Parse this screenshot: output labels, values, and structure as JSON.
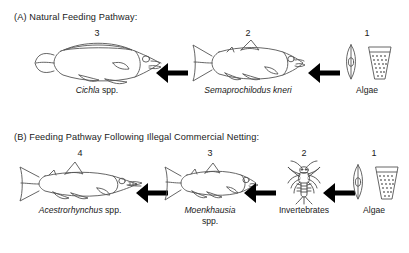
{
  "figure": {
    "panels": [
      {
        "id": "A",
        "title": "(A) Natural Feeding Pathway:",
        "nodes": [
          {
            "number": "3",
            "name_italic": "Cichla",
            "name_roman": " spp.",
            "icon": "cichlid-fish-icon"
          },
          {
            "number": "2",
            "name_italic": "Semaprochilodus kneri",
            "name_roman": "",
            "icon": "semaprochilodus-fish-icon"
          },
          {
            "number": "1",
            "name_italic": "",
            "name_roman": "Algae",
            "icon": "algae-diatom-icon"
          }
        ],
        "arrows": [
          {
            "icon": "left-arrow-icon"
          },
          {
            "icon": "left-arrow-icon"
          }
        ]
      },
      {
        "id": "B",
        "title": "(B) Feeding Pathway Following Illegal Commercial Netting:",
        "nodes": [
          {
            "number": "4",
            "name_italic": "Acestrorhynchus",
            "name_roman": " spp.",
            "icon": "acestrorhynchus-fish-icon"
          },
          {
            "number": "3",
            "name_italic": "Moenkhausia",
            "name_roman": "spp.",
            "icon": "moenkhausia-fish-icon"
          },
          {
            "number": "2",
            "name_italic": "",
            "name_roman": "Invertebrates",
            "icon": "mayfly-nymph-icon"
          },
          {
            "number": "1",
            "name_italic": "",
            "name_roman": "Algae",
            "icon": "algae-diatom-icon"
          }
        ],
        "arrows": [
          {
            "icon": "left-arrow-icon"
          },
          {
            "icon": "left-arrow-icon"
          },
          {
            "icon": "left-arrow-icon"
          }
        ]
      }
    ],
    "colors": {
      "background": "#ffffff",
      "text": "#1a1a1a",
      "line_art": "#555555",
      "arrow": "#000000"
    }
  }
}
